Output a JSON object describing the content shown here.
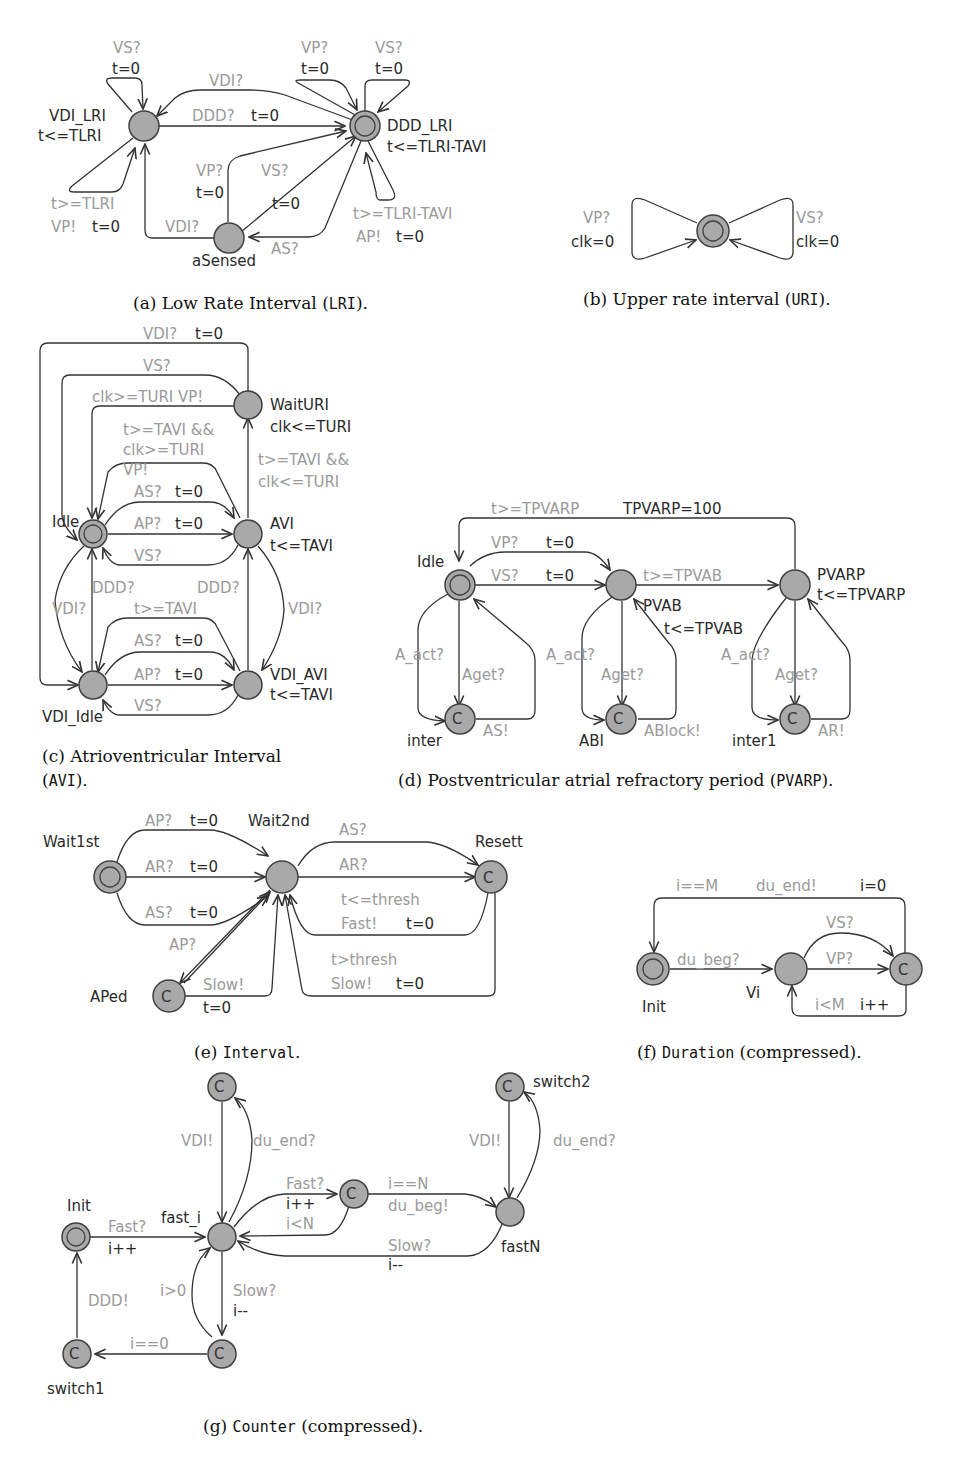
{
  "colors": {
    "node_fill": "#a9a9a9",
    "node_stroke": "#404040",
    "guard_text": "#9a9a9a",
    "label_text": "#2a2a2a"
  },
  "a": {
    "caption_prefix": "(a) Low Rate Interval (",
    "caption_code": "LRI",
    "caption_suffix": ").",
    "locations": {
      "vdi_lri": "VDI_LRI",
      "vdi_lri_inv": "t<=TLRI",
      "ddd_lri": "DDD_LRI",
      "ddd_lri_inv": "t<=TLRI-TAVI",
      "asensed": "aSensed"
    },
    "edges": {
      "self_vs_sync": "VS?",
      "self_vs_upd": "t=0",
      "vdi_top": "VDI?",
      "ddd_sync": "DDD?",
      "ddd_upd": "t=0",
      "vp_self_sync": "VP?",
      "vp_self_upd": "t=0",
      "vs_self_sync": "VS?",
      "vs_self_upd": "t=0",
      "lri_guard": "t>=TLRI",
      "lri_sync": "VP!",
      "lri_upd": "t=0",
      "as_vp_sync": "VP?",
      "as_vp_upd": "t=0",
      "as_vs_sync": "VS?",
      "as_vs_upd": "t=0",
      "as_vdi": "VDI?",
      "as_as": "AS?",
      "tavi_guard": "t>=TLRI-TAVI",
      "tavi_sync": "AP!",
      "tavi_upd": "t=0"
    }
  },
  "b": {
    "caption_prefix": "(b) Upper rate interval (",
    "caption_code": "URI",
    "caption_suffix": ").",
    "edges": {
      "vp_sync": "VP?",
      "vp_upd": "clk=0",
      "vs_sync": "VS?",
      "vs_upd": "clk=0"
    }
  },
  "c": {
    "caption_line1": "(c)  Atrioventricular  Interval",
    "caption_code": "AVI",
    "caption_suffix": ").",
    "locations": {
      "waituri": "WaitURI",
      "waituri_inv": "clk<=TURI",
      "idle": "Idle",
      "avi": "AVI",
      "avi_inv": "t<=TAVI",
      "vdi_idle": "VDI_Idle",
      "vdi_avi": "VDI_AVI",
      "vdi_avi_inv": "t<=TAVI"
    },
    "edges": {
      "outer_sync": "VDI?",
      "outer_upd": "t=0",
      "vs": "VS?",
      "turi_vp": "clk>=TURI  VP!",
      "g1": "t>=TAVI &&",
      "g2": "clk>=TURI",
      "g3": "VP!",
      "w1": "t>=TAVI &&",
      "w2": "clk<=TURI",
      "as_sync": "AS?",
      "as_upd": "t=0",
      "ap_sync": "AP?",
      "ap_upd": "t=0",
      "vs2": "VS?",
      "ddd1": "DDD?",
      "ddd2": "DDD?",
      "vdi_l": "VDI?",
      "vdi_r": "VDI?",
      "tavi": "t>=TAVI",
      "as2_sync": "AS?",
      "as2_upd": "t=0",
      "ap2_sync": "AP?",
      "ap2_upd": "t=0",
      "vs3": "VS?"
    }
  },
  "d": {
    "caption_prefix": "(d) Postventricular atrial refractory period (",
    "caption_code": "PVARP",
    "caption_suffix": ").",
    "locations": {
      "idle": "Idle",
      "pvab": "PVAB",
      "pvab_inv": "t<=TPVAB",
      "pvarp": "PVARP",
      "pvarp_inv": "t<=TPVARP",
      "inter": "inter",
      "abi": "ABI",
      "inter1": "inter1",
      "committed": "C"
    },
    "edges": {
      "top_guard": "t>=TPVARP",
      "top_upd": "TPVARP=100",
      "vp_sync": "VP?",
      "vp_upd": "t=0",
      "vs_sync": "VS?",
      "vs_upd": "t=0",
      "tpvab": "t>=TPVAB",
      "a_act1": "A_act?",
      "aget1": "Aget?",
      "as": "AS!",
      "a_act2": "A_act?",
      "aget2": "Aget?",
      "ablock": "ABlock!",
      "a_act3": "A_act?",
      "aget3": "Aget?",
      "ar": "AR!"
    }
  },
  "e": {
    "caption_prefix": "(e) ",
    "caption_code": "Interval",
    "caption_suffix": ".",
    "locations": {
      "wait1st": "Wait1st",
      "wait2nd": "Wait2nd",
      "resett": "Resett",
      "aped": "APed",
      "committed": "C"
    },
    "edges": {
      "ap_sync": "AP?",
      "ap_upd": "t=0",
      "ar_sync": "AR?",
      "ar_upd": "t=0",
      "as_sync": "AS?",
      "as_upd": "t=0",
      "r_as": "AS?",
      "r_ar": "AR?",
      "fast_guard": "t<=thresh",
      "fast_sync": "Fast!",
      "fast_upd": "t=0",
      "slow_guard": "t>thresh",
      "slow_sync": "Slow!",
      "slow_upd": "t=0",
      "ap2": "AP?",
      "slow2_sync": "Slow!",
      "slow2_upd": "t=0"
    }
  },
  "f": {
    "caption_prefix": "(f) ",
    "caption_code": "Duration",
    "caption_suffix": " (compressed).",
    "locations": {
      "init": "Init",
      "vi": "Vi",
      "committed": "C"
    },
    "edges": {
      "top_guard": "i==M",
      "top_sync": "du_end!",
      "top_upd": "i=0",
      "du_beg": "du_beg?",
      "vs": "VS?",
      "vp": "VP?",
      "back_guard": "i<M",
      "back_upd": "i++"
    }
  },
  "g": {
    "caption_prefix": "(g) ",
    "caption_code": "Counter",
    "caption_suffix": " (compressed).",
    "locations": {
      "init": "Init",
      "fast_i": "fast_i",
      "fastn": "fastN",
      "switch1": "switch1",
      "switch2": "switch2",
      "committed": "C"
    },
    "edges": {
      "fast_sync": "Fast?",
      "fast_upd": "i++",
      "vdi1": "VDI!",
      "du_end1": "du_end?",
      "fast2_sync": "Fast?",
      "fast2_upd": "i++",
      "iltn": "i<N",
      "ieqn": "i==N",
      "du_beg": "du_beg!",
      "slow_sync": "Slow?",
      "slow_upd": "i--",
      "vdi2": "VDI!",
      "du_end2": "du_end?",
      "igt0": "i>0",
      "slow2_sync": "Slow?",
      "slow2_upd": "i--",
      "ieq0": "i==0",
      "ddd": "DDD!"
    }
  }
}
